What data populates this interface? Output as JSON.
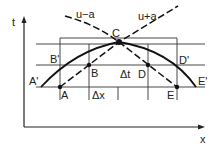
{
  "diagram": {
    "type": "characteristics-grid",
    "axes": {
      "vertical": "t",
      "horizontal": "x"
    },
    "curve_labels": {
      "left_characteristic": "u−a",
      "right_characteristic": "u+a"
    },
    "points": {
      "A": "A",
      "B": "B",
      "C": "C",
      "D": "D",
      "E": "E",
      "A_prime": "A'",
      "B_prime": "B'",
      "D_prime": "D'",
      "E_prime": "E'"
    },
    "intervals": {
      "dx": "Δx",
      "dt": "Δt"
    },
    "colors": {
      "line": "#222222",
      "background": "#ffffff"
    }
  }
}
